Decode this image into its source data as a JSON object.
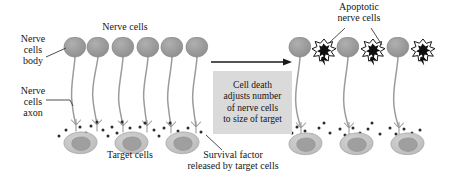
{
  "figure": {
    "background_color": "#ffffff",
    "text_color": "#151515"
  },
  "labels": {
    "nerve_cells_body": "Nerve\ncells\nbody",
    "nerve_cells_axon": "Nerve\ncells\naxon",
    "nerve_cells": "Nerve cells",
    "target_cells": "Target cells",
    "survival_factor": "Survival factor\nreleased by target cells",
    "apoptotic_nerve_cells": "Apoptotic\nnerve cells"
  },
  "center_box": {
    "text": "Cell death\nadjusts number\nof nerve cells\nto size of target",
    "fill_color": "#dadada"
  },
  "arrow": {
    "name": "process-arrow",
    "direction": "left-to-right",
    "color": "#1a1a1a"
  },
  "panels": {
    "left": {
      "nerve_cell_count": 6,
      "target_cell_count": 3,
      "apoptotic_cell_count": 0
    },
    "right": {
      "nerve_cell_count": 3,
      "target_cell_count": 3,
      "apoptotic_cell_count": 3
    }
  },
  "colors": {
    "nerve_cell_body": "#9a9a9a",
    "nerve_cell_body_dark": "#8a8a8a",
    "axon": "#9b9b9b",
    "target_cell_fill": "#c3c3c3",
    "target_cell_nucleus": "#9d9d9d",
    "survival_factor_dot": "#2d2d2d",
    "apoptotic_cell": "#111111",
    "leader_line": "#3a3a3a"
  }
}
